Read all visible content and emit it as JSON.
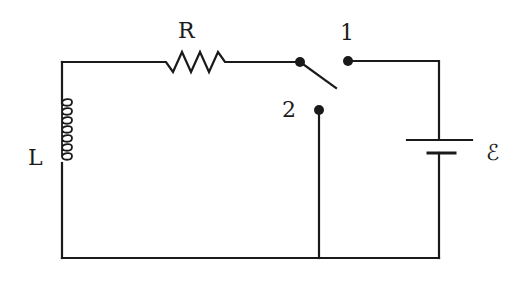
{
  "diagram": {
    "type": "RL circuit with two-position switch",
    "components": [
      {
        "id": "R",
        "kind": "resistor",
        "label": "R"
      },
      {
        "id": "L",
        "kind": "inductor",
        "label": "L"
      },
      {
        "id": "E",
        "kind": "battery",
        "label": "ℰ"
      },
      {
        "id": "S",
        "kind": "switch",
        "positions": [
          "1",
          "2"
        ]
      }
    ],
    "labels": {
      "resistor": "R",
      "inductor": "L",
      "emf": "ℰ",
      "switch_pos_1": "1",
      "switch_pos_2": "2"
    },
    "colors": {
      "ink": "#1a1a1a",
      "background": "#ffffff"
    }
  }
}
